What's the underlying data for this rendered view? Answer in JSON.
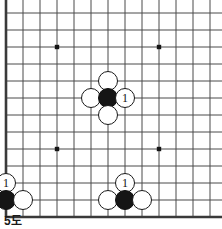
{
  "figure": {
    "caption": "5도",
    "kind": "go-board-diagram"
  },
  "board": {
    "line_color": "#4a4a4a",
    "edge_color": "#3a3a3a",
    "background_color": "#ffffff",
    "star_color": "#151515",
    "cell_size": 17,
    "origin_x": 6,
    "origin_y": 13,
    "columns": 13,
    "rows": 12,
    "edges": {
      "left": true,
      "bottom": true,
      "top": false,
      "right": false
    },
    "star_points": [
      {
        "col": 3,
        "row": 2
      },
      {
        "col": 9,
        "row": 2
      },
      {
        "col": 3,
        "row": 8
      },
      {
        "col": 9,
        "row": 8
      }
    ]
  },
  "stones": [
    {
      "id": "center-white-up",
      "color": "white",
      "col": 6,
      "row": 4,
      "label": ""
    },
    {
      "id": "center-white-left",
      "color": "white",
      "col": 5,
      "row": 5,
      "label": ""
    },
    {
      "id": "center-black",
      "color": "black",
      "col": 6,
      "row": 5,
      "label": ""
    },
    {
      "id": "center-white-right",
      "color": "white",
      "col": 7,
      "row": 5,
      "label": "1"
    },
    {
      "id": "center-white-down",
      "color": "white",
      "col": 6,
      "row": 6,
      "label": ""
    },
    {
      "id": "left-white-one",
      "color": "white",
      "col": 0,
      "row": 10,
      "label": "1"
    },
    {
      "id": "left-black-corner",
      "color": "black",
      "col": 0,
      "row": 11,
      "label": ""
    },
    {
      "id": "left-white-right",
      "color": "white",
      "col": 1,
      "row": 11,
      "label": ""
    },
    {
      "id": "bottom-white-one",
      "color": "white",
      "col": 7,
      "row": 10,
      "label": "1"
    },
    {
      "id": "bottom-white-left",
      "color": "white",
      "col": 6,
      "row": 11,
      "label": ""
    },
    {
      "id": "bottom-black",
      "color": "black",
      "col": 7,
      "row": 11,
      "label": ""
    },
    {
      "id": "bottom-white-right",
      "color": "white",
      "col": 8,
      "row": 11,
      "label": ""
    }
  ],
  "stone_radius": 10
}
